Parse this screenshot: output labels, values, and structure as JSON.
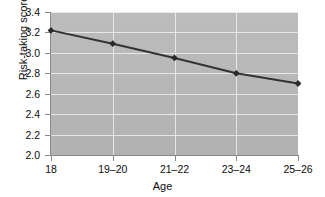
{
  "chart_data": {
    "type": "line",
    "title": "",
    "xlabel": "Age",
    "ylabel": "Risk-taking score",
    "categories": [
      "18",
      "19–20",
      "21–22",
      "23–24",
      "25–26"
    ],
    "values": [
      3.22,
      3.09,
      2.95,
      2.8,
      2.7
    ],
    "series": [
      {
        "name": "Risk-taking score",
        "values": [
          3.22,
          3.09,
          2.95,
          2.8,
          2.7
        ]
      }
    ],
    "ylim": [
      2.0,
      3.4
    ],
    "yticks": [
      "2.0",
      "2.2",
      "2.4",
      "2.6",
      "2.8",
      "3.0",
      "3.2",
      "3.4"
    ],
    "ytick_values": [
      2.0,
      2.2,
      2.4,
      2.6,
      2.8,
      3.0,
      3.2,
      3.4
    ],
    "grid": true,
    "legend": false,
    "legend_position": "none",
    "marker": "diamond",
    "line_color": "#333333",
    "marker_color": "#2b2b2b",
    "plot_background": "#b9b9b9",
    "gridline_color": "#efefef",
    "figure_background": "#ffffff"
  }
}
